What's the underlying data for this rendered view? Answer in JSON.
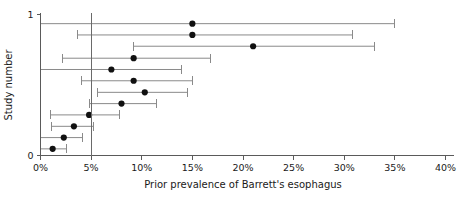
{
  "chart_data": {
    "type": "scatter",
    "subtype": "forest-plot",
    "title": "",
    "xlabel": "Prior prevalence of Barrett's esophagus",
    "ylabel": "Study number",
    "xlim": [
      0,
      40
    ],
    "ylim": [
      0,
      1
    ],
    "x_unit": "%",
    "grid": false,
    "legend": null,
    "reference_line": {
      "value": 5,
      "label": "5%",
      "orientation": "vertical"
    },
    "x_ticks": [
      0,
      5,
      10,
      15,
      20,
      25,
      30,
      35,
      40
    ],
    "x_tick_labels": [
      "0%",
      "5%",
      "10%",
      "15%",
      "20%",
      "25%",
      "30%",
      "35%",
      "40%"
    ],
    "y_ticks": [
      0,
      1
    ],
    "y_tick_labels": [
      "0",
      "1"
    ],
    "point_estimate_label": "Prior prevalence",
    "interval_label": "Confidence interval",
    "studies": [
      {
        "study": 1,
        "y": 0.935,
        "estimate": 15.0,
        "ci_low": 0.0,
        "ci_high": 35.0,
        "cap_low": false,
        "cap_high": true
      },
      {
        "study": 2,
        "y": 0.855,
        "estimate": 15.0,
        "ci_low": 3.7,
        "ci_high": 30.8,
        "cap_low": true,
        "cap_high": true
      },
      {
        "study": 3,
        "y": 0.775,
        "estimate": 21.0,
        "ci_low": 9.2,
        "ci_high": 33.0,
        "cap_low": true,
        "cap_high": true
      },
      {
        "study": 4,
        "y": 0.69,
        "estimate": 9.2,
        "ci_low": 2.2,
        "ci_high": 16.8,
        "cap_low": true,
        "cap_high": true
      },
      {
        "study": 5,
        "y": 0.61,
        "estimate": 7.0,
        "ci_low": 0.0,
        "ci_high": 13.9,
        "cap_low": false,
        "cap_high": true
      },
      {
        "study": 6,
        "y": 0.53,
        "estimate": 9.2,
        "ci_low": 4.0,
        "ci_high": 15.0,
        "cap_low": true,
        "cap_high": true
      },
      {
        "study": 7,
        "y": 0.448,
        "estimate": 10.3,
        "ci_low": 5.6,
        "ci_high": 14.5,
        "cap_low": true,
        "cap_high": true
      },
      {
        "study": 8,
        "y": 0.368,
        "estimate": 8.0,
        "ci_low": 4.8,
        "ci_high": 11.5,
        "cap_low": true,
        "cap_high": true
      },
      {
        "study": 9,
        "y": 0.288,
        "estimate": 4.8,
        "ci_low": 1.0,
        "ci_high": 7.8,
        "cap_low": true,
        "cap_high": true
      },
      {
        "study": 10,
        "y": 0.207,
        "estimate": 3.3,
        "ci_low": 1.1,
        "ci_high": 5.2,
        "cap_low": true,
        "cap_high": true
      },
      {
        "study": 11,
        "y": 0.127,
        "estimate": 2.3,
        "ci_low": 0.0,
        "ci_high": 4.1,
        "cap_low": false,
        "cap_high": true
      },
      {
        "study": 12,
        "y": 0.047,
        "estimate": 1.2,
        "ci_low": 0.0,
        "ci_high": 2.6,
        "cap_low": false,
        "cap_high": true
      }
    ]
  },
  "colors": {
    "marker": "#111111",
    "interval": "#8a8a8a",
    "axis": "#5a5a5a",
    "reference": "#6a6a6a",
    "text": "#1a1a1a",
    "background": "#ffffff"
  }
}
